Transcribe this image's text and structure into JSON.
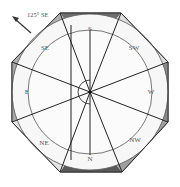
{
  "diagram": {
    "type": "octagonal-compass-room",
    "annotation": {
      "label": "125° SE",
      "arrow": "pointer-arrow-northwest"
    },
    "center": [
      90,
      92
    ],
    "directions": [
      {
        "label": "S",
        "x": 90,
        "y": 30
      },
      {
        "label": "SW",
        "x": 134,
        "y": 48
      },
      {
        "label": "W",
        "x": 151,
        "y": 91
      },
      {
        "label": "NW",
        "x": 134,
        "y": 140
      },
      {
        "label": "N",
        "x": 90,
        "y": 160
      },
      {
        "label": "NE",
        "x": 44,
        "y": 142
      },
      {
        "label": "E",
        "x": 27,
        "y": 91
      },
      {
        "label": "SE",
        "x": 44,
        "y": 48
      }
    ],
    "colors": {
      "dark_band": "#6e6e6e",
      "mid_band": "#a8a8a8",
      "light_band": "#e2e2e2",
      "inner_fill": "#f7f7f7",
      "stroke": "#222222",
      "ring_stroke": "#555555"
    }
  }
}
